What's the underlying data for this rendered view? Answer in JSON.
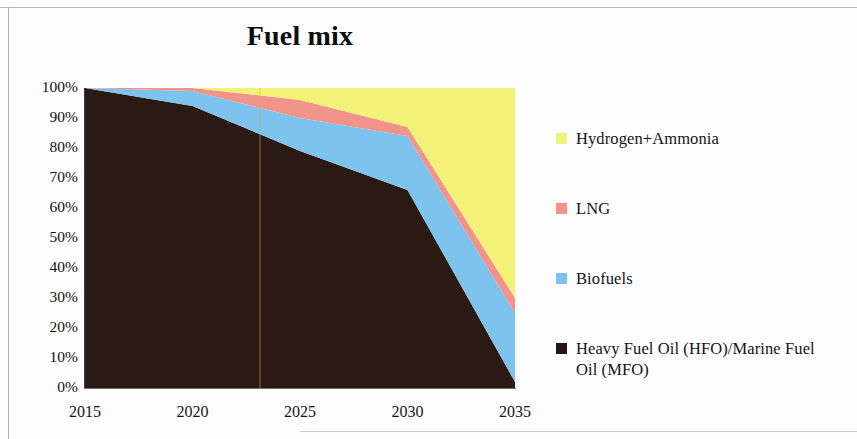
{
  "chart_data": {
    "type": "area",
    "title": "Fuel mix",
    "subtitle": "",
    "xlabel": "",
    "ylabel": "",
    "stacked": true,
    "stack_mode": "percent",
    "grid": false,
    "legend_position": "right",
    "x": [
      2015,
      2020,
      2025,
      2030,
      2035
    ],
    "categories": [
      "2015",
      "2020",
      "2025",
      "2030",
      "2035"
    ],
    "xticklabels": [
      "2015",
      "2020",
      "2025",
      "2030",
      "2035"
    ],
    "yticklabels": [
      "100%",
      "90%",
      "80%",
      "70%",
      "60%",
      "50%",
      "40%",
      "30%",
      "20%",
      "10%",
      "0%"
    ],
    "ylim": [
      0,
      100
    ],
    "xlim": [
      2015,
      2035
    ],
    "ytick_values": [
      100,
      90,
      80,
      70,
      60,
      50,
      40,
      30,
      20,
      10,
      0
    ],
    "series": [
      {
        "name": "Heavy Fuel Oil (HFO)/Marine Fuel Oil (MFO)",
        "color": "#2b1a14",
        "values": [
          100,
          94,
          79,
          66,
          2
        ]
      },
      {
        "name": "Biofuels",
        "color": "#7ec2ee",
        "values": [
          0,
          5,
          11,
          18,
          23
        ]
      },
      {
        "name": "LNG",
        "color": "#f2948a",
        "values": [
          0,
          1,
          6,
          3,
          5
        ]
      },
      {
        "name": "Hydrogen+Ammonia",
        "color": "#f2f279",
        "values": [
          0,
          0,
          4,
          13,
          70
        ]
      }
    ]
  },
  "legend": {
    "items": [
      {
        "label": "Hydrogen+Ammonia",
        "color": "#eef27a",
        "swatch": "legend-swatch-hydrogen-ammonia"
      },
      {
        "label": "LNG",
        "color": "#f2948a",
        "swatch": "legend-swatch-lng"
      },
      {
        "label": "Biofuels",
        "color": "#7ec2ee",
        "swatch": "legend-swatch-biofuels"
      },
      {
        "label": "Heavy Fuel Oil (HFO)/Marine Fuel Oil (MFO)",
        "color": "#241610",
        "swatch": "legend-swatch-hfo-mfo"
      }
    ]
  },
  "axes": {
    "y": {
      "labels": [
        "100%",
        "90%",
        "80%",
        "70%",
        "60%",
        "50%",
        "40%",
        "30%",
        "20%",
        "10%",
        "0%"
      ]
    },
    "x": {
      "labels": [
        "2015",
        "2020",
        "2025",
        "2030",
        "2035"
      ]
    }
  },
  "colors": {
    "hydrogen_ammonia": "#f2f279",
    "lng": "#f2948a",
    "biofuels": "#7ec2ee",
    "hfo_mfo": "#2b1a14",
    "axis": "#3b3b3b",
    "text": "#131313",
    "background": "#fdfdfd"
  }
}
